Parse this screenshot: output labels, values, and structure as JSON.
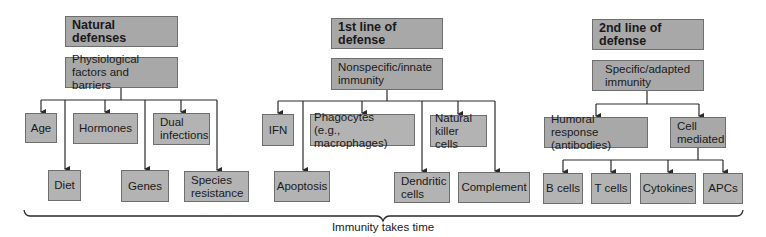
{
  "diagram": {
    "columns": [
      {
        "header": "Natural defenses",
        "category": "Physiological\nfactors and barriers",
        "items": [
          "Age",
          "Hormones",
          "Dual\ninfections",
          "Diet",
          "Genes",
          "Species\nresistance"
        ]
      },
      {
        "header": "1st line of defense",
        "category": "Nonspecific/innate\nimmunity",
        "items": [
          "IFN",
          "Phagocytes\n(e.g., macrophages)",
          "Natural\nkiller cells",
          "Apoptosis",
          "Dendritic\ncells",
          "Complement"
        ]
      },
      {
        "header": "2nd line of defense",
        "category": "Specific/adapted\nimmunity",
        "branches": [
          "Humoral response\n(antibodies)",
          "Cell\nmediated"
        ],
        "items": [
          "B cells",
          "T cells",
          "Cytokines",
          "APCs"
        ]
      }
    ],
    "caption": "Immunity takes time",
    "colors": {
      "box_fill": "#a8a8a8",
      "box_fill_light": "#b3b3b3",
      "box_border": "#6e6e6e",
      "line": "#2a2a2a",
      "background": "#ffffff"
    }
  }
}
